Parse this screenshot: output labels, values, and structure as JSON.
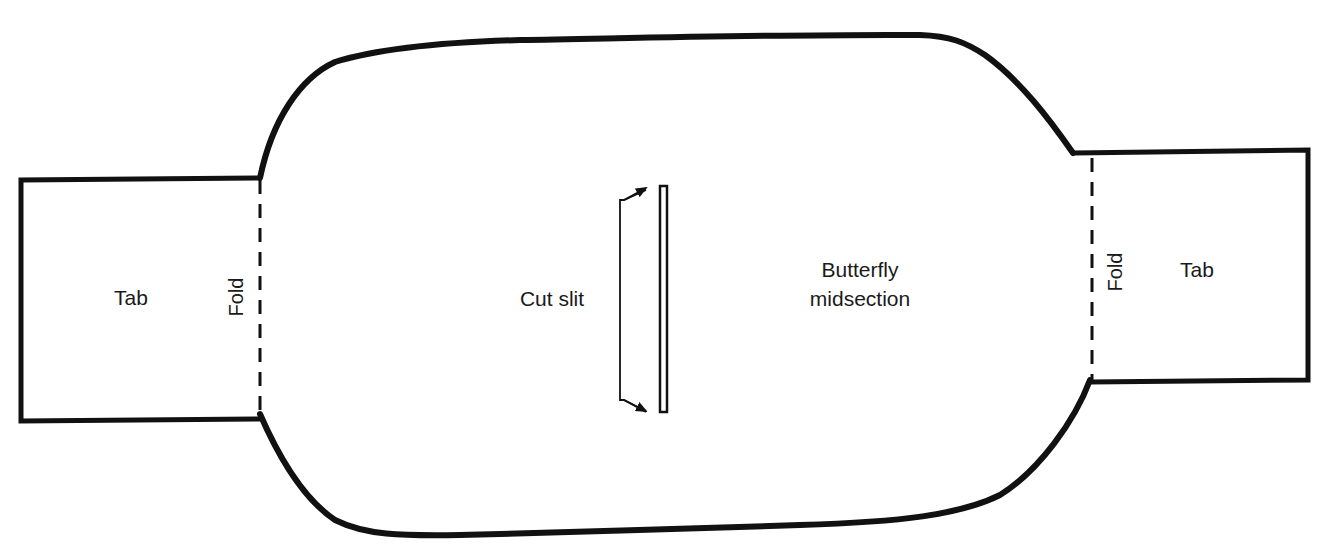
{
  "diagram": {
    "colors": {
      "stroke": "#111111",
      "background": "#ffffff",
      "text": "#1a1a1a"
    },
    "left_tab": {
      "label": "Tab",
      "fold_label": "Fold"
    },
    "right_tab": {
      "label": "Tab",
      "fold_label": "Fold"
    },
    "cut_slit": {
      "label": "Cut slit"
    },
    "midsection": {
      "label_line1": "Butterfly",
      "label_line2": "midsection"
    }
  }
}
